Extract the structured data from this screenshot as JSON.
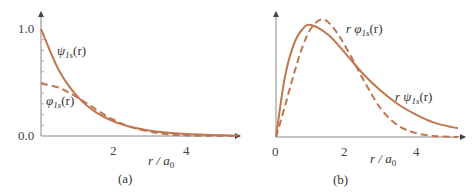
{
  "colors": {
    "curve": "#c0764e",
    "axis": "#777777"
  },
  "chart_data": [
    {
      "id": "a",
      "type": "line",
      "caption": "(a)",
      "xlabel": "r/a0",
      "xlabel_main": "r / a",
      "xlabel_sub": "0",
      "xlim": [
        0,
        5.4
      ],
      "ylim": [
        0,
        1.0
      ],
      "xticks": [
        2,
        4
      ],
      "yticks": [
        {
          "v": 0.0,
          "label": "0.0"
        },
        {
          "v": 1.0,
          "label": "1.0"
        }
      ],
      "series": [
        {
          "name": "psi_1s(r)",
          "label_main": "ψ",
          "label_sub": "1s",
          "label_tail": "(r)",
          "style": "solid",
          "x": [
            0,
            0.5,
            1,
            1.5,
            2,
            2.5,
            3,
            3.5,
            4,
            4.5,
            5,
            5.4
          ],
          "y": [
            1.0,
            0.607,
            0.368,
            0.223,
            0.135,
            0.082,
            0.05,
            0.03,
            0.018,
            0.011,
            0.007,
            0.005
          ]
        },
        {
          "name": "phi_1s(r)",
          "label_main": "φ",
          "label_sub": "1s",
          "label_tail": "(r)",
          "style": "dashed",
          "x": [
            0,
            0.5,
            1,
            1.5,
            2,
            2.5,
            3,
            3.5,
            4,
            4.5,
            5,
            5.4
          ],
          "y": [
            0.49,
            0.45,
            0.36,
            0.25,
            0.15,
            0.08,
            0.04,
            0.015,
            0.005,
            0.002,
            0.0005,
            0.0
          ]
        }
      ]
    },
    {
      "id": "b",
      "type": "line",
      "caption": "(b)",
      "xlabel": "r/a0",
      "xlabel_main": "r / a",
      "xlabel_sub": "0",
      "xlim": [
        0,
        5.4
      ],
      "ylim": [
        0,
        1.0
      ],
      "xticks": [
        {
          "v": 0,
          "label": "0"
        },
        {
          "v": 2,
          "label": "2"
        },
        {
          "v": 4,
          "label": "4"
        }
      ],
      "series": [
        {
          "name": "r psi_1s(r)",
          "label_main": "r ψ",
          "label_sub": "1s",
          "label_tail": "(r)",
          "style": "solid",
          "x": [
            0,
            0.25,
            0.5,
            0.75,
            1,
            1.5,
            2,
            2.5,
            3,
            3.5,
            4,
            4.5,
            5,
            5.2
          ],
          "y": [
            0,
            0.53,
            0.82,
            0.96,
            1.0,
            0.91,
            0.74,
            0.56,
            0.41,
            0.29,
            0.2,
            0.13,
            0.09,
            0.08
          ]
        },
        {
          "name": "r phi_1s(r)",
          "label_main": "r φ",
          "label_sub": "1s",
          "label_tail": "(r)",
          "style": "dashed",
          "x": [
            0,
            0.25,
            0.5,
            0.75,
            1,
            1.3,
            1.6,
            2,
            2.5,
            3,
            3.5,
            4,
            4.5,
            5,
            5.2
          ],
          "y": [
            0,
            0.27,
            0.55,
            0.8,
            0.97,
            1.05,
            0.99,
            0.8,
            0.51,
            0.25,
            0.1,
            0.035,
            0.01,
            0.003,
            0.0
          ]
        }
      ]
    }
  ]
}
